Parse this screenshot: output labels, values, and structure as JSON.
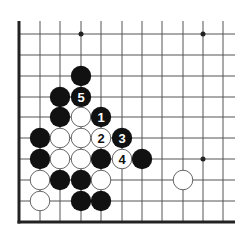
{
  "diagram": {
    "type": "go-board-fragment",
    "edges": [
      "left",
      "bottom"
    ],
    "columns_x": [
      19,
      40,
      60,
      81,
      101,
      122,
      142,
      162,
      183,
      203,
      223
    ],
    "rows_y": [
      34,
      55,
      76,
      97,
      117,
      138,
      159,
      180,
      201,
      222
    ],
    "line_extend": {
      "top": 21,
      "right": 235
    },
    "star_points": [
      {
        "col": 3,
        "row": 0
      },
      {
        "col": 9,
        "row": 0
      },
      {
        "col": 9,
        "row": 6
      }
    ],
    "stones": [
      {
        "col": 3,
        "row": 2,
        "color": "black",
        "label": ""
      },
      {
        "col": 2,
        "row": 3,
        "color": "black",
        "label": ""
      },
      {
        "col": 3,
        "row": 3,
        "color": "black",
        "label": "5"
      },
      {
        "col": 2,
        "row": 4,
        "color": "black",
        "label": ""
      },
      {
        "col": 3,
        "row": 4,
        "color": "white",
        "label": ""
      },
      {
        "col": 4,
        "row": 4,
        "color": "black",
        "label": "1"
      },
      {
        "col": 1,
        "row": 5,
        "color": "black",
        "label": ""
      },
      {
        "col": 2,
        "row": 5,
        "color": "white",
        "label": ""
      },
      {
        "col": 3,
        "row": 5,
        "color": "white",
        "label": ""
      },
      {
        "col": 4,
        "row": 5,
        "color": "white",
        "label": "2"
      },
      {
        "col": 5,
        "row": 5,
        "color": "black",
        "label": "3"
      },
      {
        "col": 1,
        "row": 6,
        "color": "black",
        "label": ""
      },
      {
        "col": 2,
        "row": 6,
        "color": "white",
        "label": ""
      },
      {
        "col": 3,
        "row": 6,
        "color": "white",
        "label": ""
      },
      {
        "col": 4,
        "row": 6,
        "color": "black",
        "label": ""
      },
      {
        "col": 5,
        "row": 6,
        "color": "white",
        "label": "4"
      },
      {
        "col": 6,
        "row": 6,
        "color": "black",
        "label": ""
      },
      {
        "col": 1,
        "row": 7,
        "color": "white",
        "label": ""
      },
      {
        "col": 2,
        "row": 7,
        "color": "black",
        "label": ""
      },
      {
        "col": 3,
        "row": 7,
        "color": "black",
        "label": ""
      },
      {
        "col": 4,
        "row": 7,
        "color": "white",
        "label": ""
      },
      {
        "col": 8,
        "row": 7,
        "color": "white",
        "label": ""
      },
      {
        "col": 1,
        "row": 8,
        "color": "white",
        "label": ""
      },
      {
        "col": 3,
        "row": 8,
        "color": "black",
        "label": ""
      },
      {
        "col": 4,
        "row": 8,
        "color": "black",
        "label": ""
      }
    ],
    "colors": {
      "line": "#555555",
      "edge": "#222222",
      "black_stone": "#111111",
      "white_stone": "#ffffff",
      "white_stroke": "#555555"
    }
  }
}
